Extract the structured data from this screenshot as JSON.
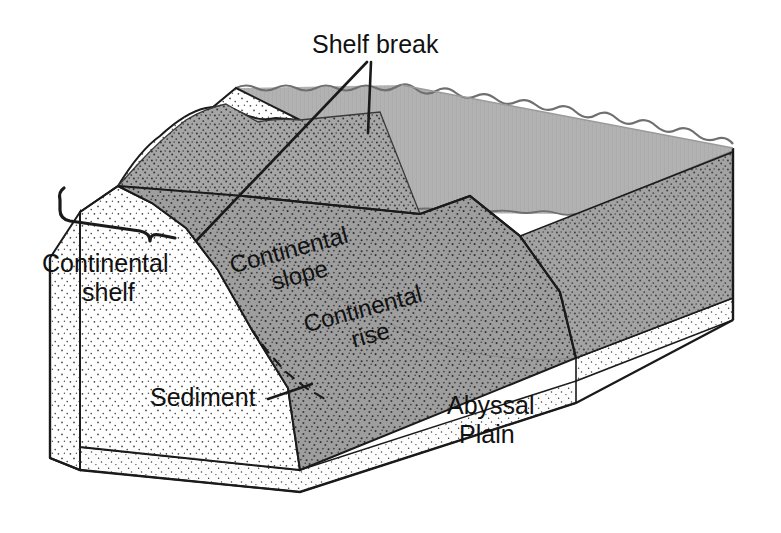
{
  "figure": {
    "type": "geologic-block-diagram",
    "background_color": "#ffffff",
    "line_color": "#1a1a1a"
  },
  "labels": {
    "shelf_break": "Shelf break",
    "continental_shelf_line1": "Continental",
    "continental_shelf_line2": "shelf",
    "continental_slope_line1": "Continental",
    "continental_slope_line2": "slope",
    "continental_rise_line1": "Continental",
    "continental_rise_line2": "rise",
    "sediment": "Sediment",
    "abyssal_plain_line1": "Abyssal",
    "abyssal_plain_line2": "Plain"
  },
  "colors": {
    "water_top": "#b2b2b2",
    "water_side": "#838383",
    "seafloor_gray": "#a6a6a6",
    "seafloor_dark": "#9a9a9a",
    "slope_gray": "#9e9e9e",
    "land_white": "#ffffff",
    "basement_white": "#fbfbfb",
    "outline": "#1a1a1a",
    "stipple_dot": "#2b2b2b"
  },
  "features": [
    {
      "name": "continental-shelf",
      "label": "Continental shelf"
    },
    {
      "name": "shelf-break",
      "label": "Shelf break"
    },
    {
      "name": "continental-slope",
      "label": "Continental slope"
    },
    {
      "name": "continental-rise",
      "label": "Continental rise"
    },
    {
      "name": "abyssal-plain",
      "label": "Abyssal Plain"
    },
    {
      "name": "sediment",
      "label": "Sediment"
    }
  ]
}
